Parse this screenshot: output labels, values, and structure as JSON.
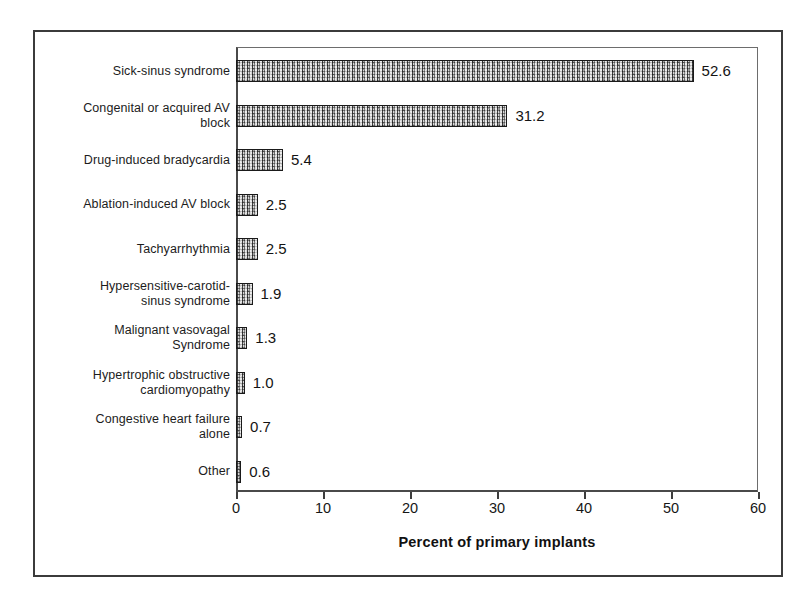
{
  "chart_data": {
    "type": "bar",
    "orientation": "horizontal",
    "title": "",
    "xlabel": "Percent of primary implants",
    "ylabel": "",
    "xlim": [
      0,
      60
    ],
    "xticks": [
      0,
      10,
      20,
      30,
      40,
      50,
      60
    ],
    "grid": false,
    "legend": false,
    "categories": [
      "Sick-sinus syndrome",
      "Congenital or acquired AV block",
      "Drug-induced bradycardia",
      "Ablation-induced AV block",
      "Tachyarrhythmia",
      "Hypersensitive-carotid-sinus syndrome",
      "Malignant vasovagal Syndrome",
      "Hypertrophic obstructive cardiomyopathy",
      "Congestive heart failure alone",
      "Other"
    ],
    "category_lines": [
      [
        "Sick-sinus syndrome"
      ],
      [
        "Congenital or acquired AV",
        "block"
      ],
      [
        "Drug-induced bradycardia"
      ],
      [
        "Ablation-induced AV block"
      ],
      [
        "Tachyarrhythmia"
      ],
      [
        "Hypersensitive-carotid-",
        "sinus syndrome"
      ],
      [
        "Malignant vasovagal",
        "Syndrome"
      ],
      [
        "Hypertrophic obstructive",
        "cardiomyopathy"
      ],
      [
        "Congestive heart failure",
        "alone"
      ],
      [
        "Other"
      ]
    ],
    "values": [
      52.6,
      31.2,
      5.4,
      2.5,
      2.5,
      1.9,
      1.3,
      1.0,
      0.7,
      0.6
    ],
    "value_labels": [
      "52.6",
      "31.2",
      "5.4",
      "2.5",
      "2.5",
      "1.9",
      "1.3",
      "1.0",
      "0.7",
      "0.6"
    ],
    "bar_fill_color": "#b4b4b4",
    "bar_edge_color": "#1a1a1a",
    "axis_color": "#3d3d3d",
    "text_color": "#161616"
  }
}
